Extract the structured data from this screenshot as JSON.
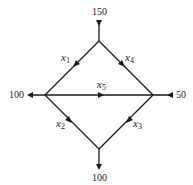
{
  "diagram": {
    "type": "network-flow",
    "nodes": [
      {
        "id": "top",
        "external_flow": "150",
        "direction": "in"
      },
      {
        "id": "left",
        "external_flow": "100",
        "direction": "out"
      },
      {
        "id": "right",
        "external_flow": "50",
        "direction": "in"
      },
      {
        "id": "bottom",
        "external_flow": "100",
        "direction": "out"
      }
    ],
    "edges": [
      {
        "label": "x",
        "sub": "1",
        "from": "top",
        "to": "left"
      },
      {
        "label": "x",
        "sub": "4",
        "from": "top",
        "to": "right"
      },
      {
        "label": "x",
        "sub": "5",
        "from": "left",
        "to": "right"
      },
      {
        "label": "x",
        "sub": "2",
        "from": "left",
        "to": "bottom"
      },
      {
        "label": "x",
        "sub": "3",
        "from": "right",
        "to": "bottom"
      }
    ],
    "labels": {
      "top": "150",
      "left": "100",
      "right": "50",
      "bottom": "100"
    },
    "colors": {
      "line": "#1a1a1a"
    }
  }
}
